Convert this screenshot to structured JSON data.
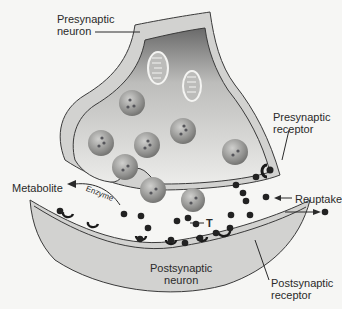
{
  "diagram": {
    "labels": {
      "presynaptic_neuron": [
        "Presynaptic",
        "neuron"
      ],
      "presynaptic_receptor": [
        "Presynaptic",
        "receptor"
      ],
      "metabolite": "Metabolite",
      "enzyme": "Enzyme",
      "reuptake": "Reuptake",
      "transmitter": "T",
      "postsynaptic_neuron": [
        "Postsynaptic",
        "neuron"
      ],
      "postsynaptic_receptor": [
        "Postsynaptic",
        "receptor"
      ]
    },
    "colors": {
      "background": "#f6f6f4",
      "neuron_fill": "#d2d2d0",
      "membrane_line": "#3a3a3a",
      "cytoplasm_dark": "#6a6a6a",
      "cytoplasm_light": "#e8e8e6",
      "vesicle": "#9a9a98",
      "transmitter_dot": "#222222"
    }
  }
}
